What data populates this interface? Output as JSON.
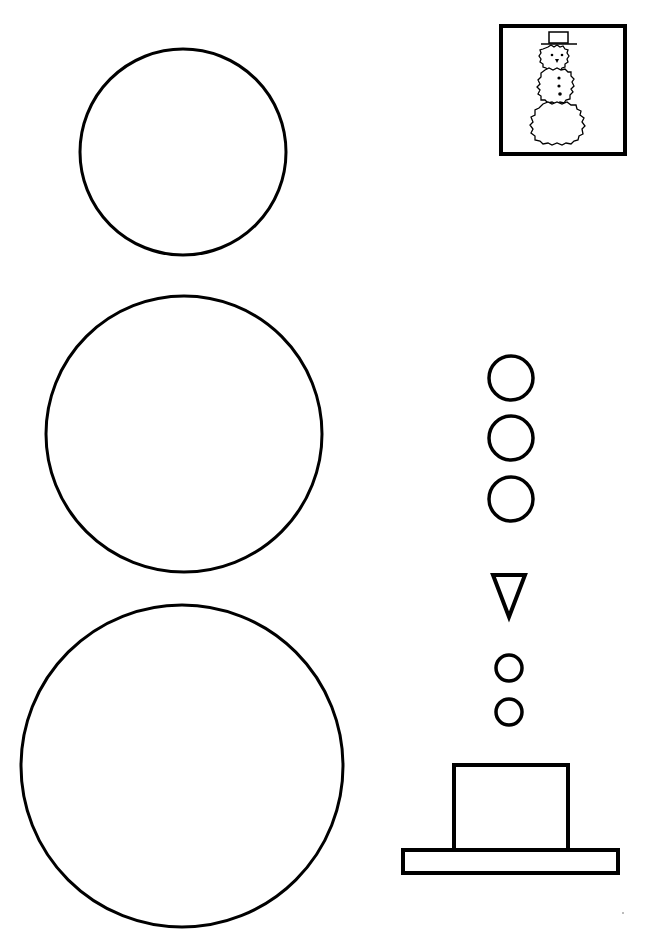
{
  "page": {
    "kind": "snowman cut-out craft template",
    "background": "#ffffff",
    "stroke_color": "#000000"
  },
  "pieces": {
    "small_ball": {
      "label": "head circle",
      "cx": 183,
      "cy": 152,
      "r": 103
    },
    "medium_ball": {
      "label": "middle circle",
      "cx": 184,
      "cy": 434,
      "r": 138
    },
    "large_ball": {
      "label": "bottom circle",
      "cx": 182,
      "cy": 766,
      "r": 161
    },
    "buttons": [
      {
        "label": "button 1",
        "cx": 511,
        "cy": 378,
        "r": 22
      },
      {
        "label": "button 2",
        "cx": 511,
        "cy": 438,
        "r": 22
      },
      {
        "label": "button 3",
        "cx": 511,
        "cy": 499,
        "r": 22
      }
    ],
    "nose": {
      "label": "carrot nose triangle",
      "points": "493,575 525,575 509,617"
    },
    "eyes": [
      {
        "label": "eye 1",
        "cx": 509,
        "cy": 668,
        "r": 13
      },
      {
        "label": "eye 2",
        "cx": 509,
        "cy": 712,
        "r": 13
      }
    ],
    "hat_crown": {
      "label": "hat crown",
      "x": 454,
      "y": 765,
      "w": 114,
      "h": 85
    },
    "hat_brim": {
      "label": "hat brim",
      "x": 403,
      "y": 850,
      "w": 215,
      "h": 23
    }
  },
  "preview": {
    "label": "finished snowman thumbnail",
    "x": 501,
    "y": 26,
    "w": 124,
    "h": 128
  }
}
